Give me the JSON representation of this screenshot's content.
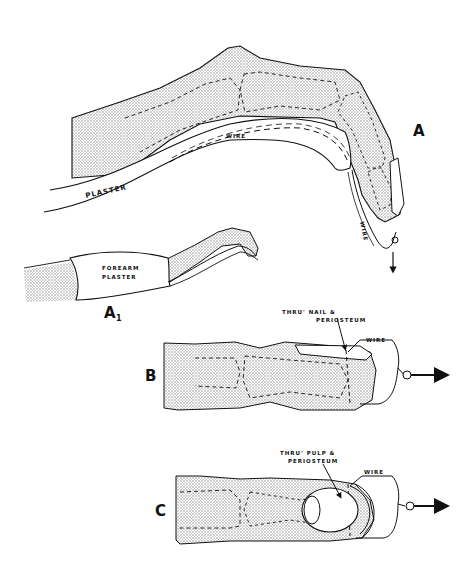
{
  "figure": {
    "panels": [
      {
        "id": "A",
        "label": "A",
        "annotations": [
          "PLASTER",
          "WIRE",
          "WIRE"
        ]
      },
      {
        "id": "A1",
        "label": "A",
        "subscript": "1",
        "annotations": [
          "FOREARM",
          "PLASTER"
        ]
      },
      {
        "id": "B",
        "label": "B",
        "annotations": [
          "THRU' NAIL &",
          "PERIOSTEUM",
          "WIRE"
        ]
      },
      {
        "id": "C",
        "label": "C",
        "annotations": [
          "THRU' PULP &",
          "PERIOSTEUM",
          "WIRE"
        ]
      }
    ]
  },
  "labels": {
    "a": "A",
    "a1": "A",
    "a1_sub": "1",
    "b": "B",
    "c": "C",
    "plaster": "PLASTER",
    "wire_a_top": "WIRE",
    "wire_a_tip": "WIRE",
    "forearm1": "FOREARM",
    "forearm2": "PLASTER",
    "b_note1": "THRU' NAIL &",
    "b_note2": "PERIOSTEUM",
    "b_wire": "WIRE",
    "c_note1": "THRU' PULP &",
    "c_note2": "PERIOSTEUM",
    "c_wire": "WIRE"
  },
  "colors": {
    "ink": "#111111",
    "shade": "#d0d0d0",
    "paper": "#ffffff"
  }
}
